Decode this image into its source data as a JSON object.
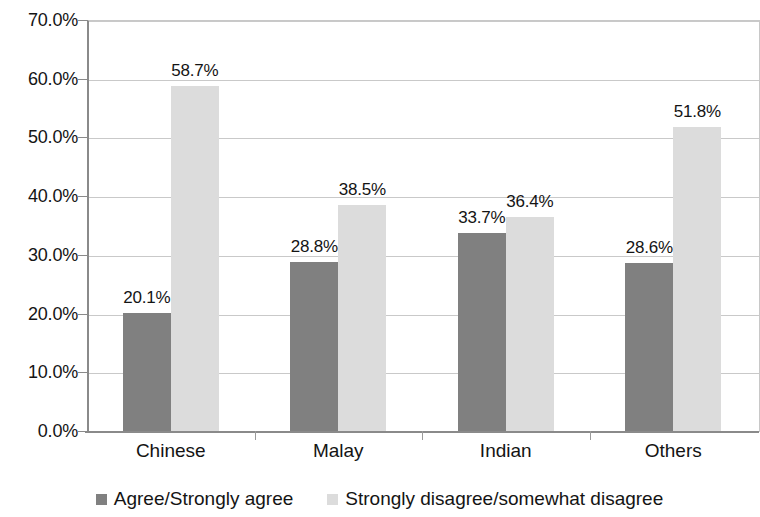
{
  "chart_data": {
    "type": "bar",
    "title": "",
    "subtitle": "",
    "xlabel": "",
    "ylabel": "",
    "categories": [
      "Chinese",
      "Malay",
      "Indian",
      "Others"
    ],
    "series": [
      {
        "name": "Agree/Strongly agree",
        "color": "#808080",
        "values": [
          20.1,
          28.8,
          33.7,
          28.6
        ],
        "labels": [
          "20.1%",
          "28.8%",
          "33.7%",
          "28.6%"
        ]
      },
      {
        "name": "Strongly disagree/somewhat disagree",
        "color": "#dcdcdc",
        "values": [
          58.7,
          38.5,
          36.4,
          51.8
        ],
        "labels": [
          "58.7%",
          "38.5%",
          "36.4%",
          "51.8%"
        ]
      }
    ],
    "ylim": [
      0,
      70
    ],
    "ytick_values": [
      0,
      10,
      20,
      30,
      40,
      50,
      60,
      70
    ],
    "ytick_labels": [
      "0.0%",
      "10.0%",
      "20.0%",
      "30.0%",
      "40.0%",
      "50.0%",
      "60.0%",
      "70.0%"
    ],
    "grid": true,
    "legend_position": "bottom",
    "value_labels_shown": true
  },
  "legend": {
    "items": [
      {
        "label": "Agree/Strongly agree",
        "swatch": "legend-swatch-dark"
      },
      {
        "label": "Strongly disagree/somewhat disagree",
        "swatch": "legend-swatch-light"
      }
    ]
  },
  "colors": {
    "series_0": "#808080",
    "series_1": "#dcdcdc",
    "gridline": "#c9c9c9",
    "axis": "#8a8a8a",
    "text": "#141414",
    "background": "#ffffff"
  }
}
